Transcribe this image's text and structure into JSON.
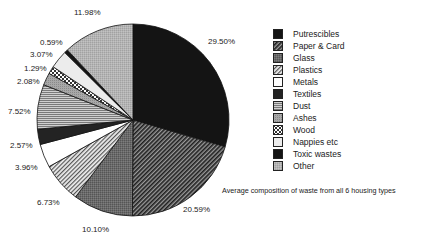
{
  "chart_data": {
    "type": "pie",
    "title": "Average composition of waste from all 6 housing types",
    "start_angle_deg": 0,
    "direction": "clockwise",
    "categories": [
      "Putrescibles",
      "Paper & Card",
      "Glass",
      "Plastics",
      "Metals",
      "Textiles",
      "Dust",
      "Ashes",
      "Wood",
      "Nappies etc",
      "Toxic wastes",
      "Other"
    ],
    "values": [
      29.5,
      20.59,
      10.1,
      6.73,
      3.96,
      2.57,
      7.52,
      2.08,
      1.29,
      3.07,
      0.59,
      11.98
    ],
    "labels": [
      "29.50%",
      "20.59%",
      "10.10%",
      "6.73%",
      "3.96%",
      "2.57%",
      "7.52%",
      "2.08%",
      "1.29%",
      "3.07%",
      "0.59%",
      "11.98%"
    ],
    "patterns": [
      "solid-black",
      "diagonal-hatch-dark",
      "gray-stipple",
      "diagonal-hatch-light",
      "white",
      "solid-dark",
      "horizontal-lines",
      "gray-dots",
      "checker",
      "light-gray",
      "solid-black",
      "light-gray-stipple"
    ],
    "legend_position": "right"
  },
  "label_positions": [
    {
      "x": 208,
      "y": 37
    },
    {
      "x": 183,
      "y": 205
    },
    {
      "x": 82,
      "y": 225
    },
    {
      "x": 37,
      "y": 198
    },
    {
      "x": 15,
      "y": 163
    },
    {
      "x": 10,
      "y": 141
    },
    {
      "x": 8,
      "y": 107
    },
    {
      "x": 17,
      "y": 77
    },
    {
      "x": 24,
      "y": 64
    },
    {
      "x": 30,
      "y": 50
    },
    {
      "x": 40,
      "y": 38
    },
    {
      "x": 74,
      "y": 8
    }
  ],
  "legend": {
    "items": [
      {
        "label": "Putrescibles"
      },
      {
        "label": "Paper & Card"
      },
      {
        "label": "Glass"
      },
      {
        "label": "Plastics"
      },
      {
        "label": "Metals"
      },
      {
        "label": "Textiles"
      },
      {
        "label": "Dust"
      },
      {
        "label": "Ashes"
      },
      {
        "label": "Wood"
      },
      {
        "label": "Nappies etc"
      },
      {
        "label": "Toxic wastes"
      },
      {
        "label": "Other"
      }
    ]
  },
  "caption": "Average composition of waste from all 6 housing types"
}
